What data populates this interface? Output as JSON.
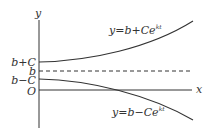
{
  "diagram": {
    "axes": {
      "x_label": "x",
      "y_label": "y",
      "origin_label": "O"
    },
    "y_ticks": [
      {
        "label": "b+C",
        "y": 62
      },
      {
        "label": "b",
        "y": 71
      },
      {
        "label": "b−C",
        "y": 79
      },
      {
        "label": "O",
        "y": 90
      }
    ],
    "curves": [
      {
        "name": "upper",
        "equation_prefix": "y=b+Ce",
        "exponent": "kt"
      },
      {
        "name": "lower",
        "equation_prefix": "y=b−Ce",
        "exponent": "kt"
      }
    ],
    "asymptote": {
      "label": "b",
      "style": "dashed"
    },
    "colors": {
      "line": "#333333",
      "background": "#ffffff"
    }
  }
}
